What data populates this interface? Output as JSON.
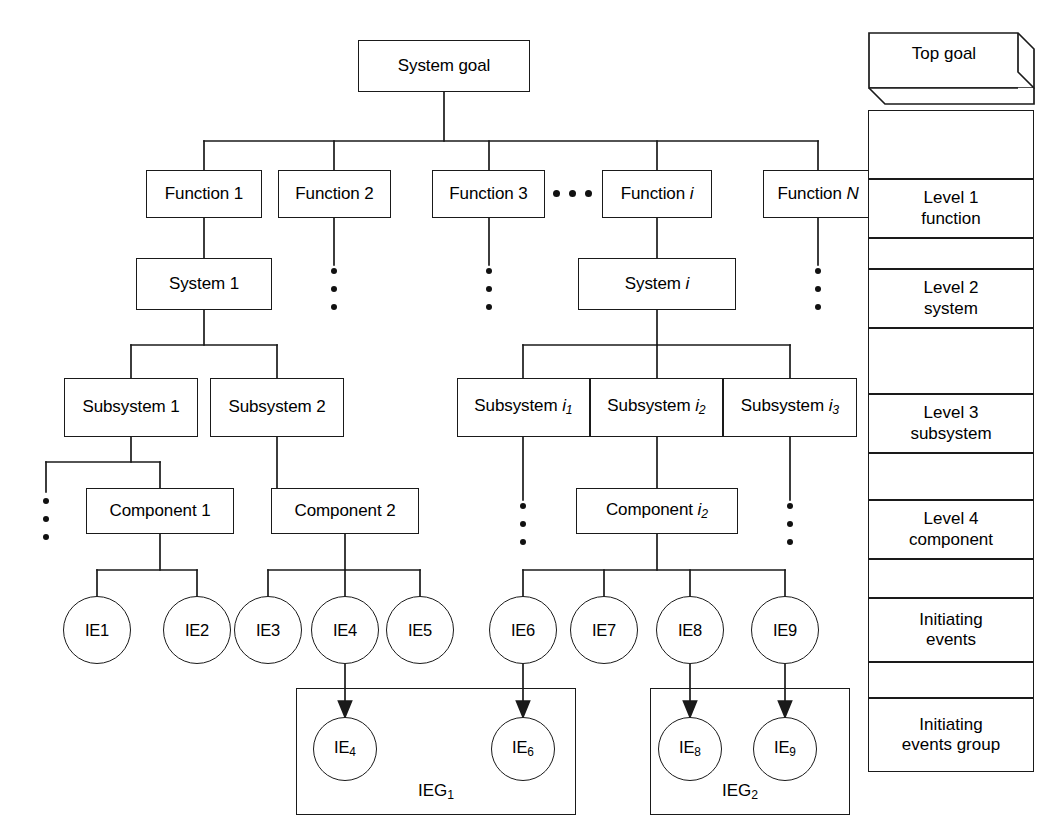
{
  "diagram": {
    "top": {
      "label": "System goal"
    },
    "functions": [
      {
        "label": "Function 1"
      },
      {
        "label": "Function 2"
      },
      {
        "label": "Function 3"
      },
      {
        "label": "Function i"
      },
      {
        "label": "Function N"
      }
    ],
    "systems": [
      {
        "label": "System 1"
      },
      {
        "label": "System i"
      }
    ],
    "subsystems": [
      {
        "label": "Subsystem 1"
      },
      {
        "label": "Subsystem 2"
      },
      {
        "label": "Subsystem i1"
      },
      {
        "label": "Subsystem i2"
      },
      {
        "label": "Subsystem i3"
      }
    ],
    "components": [
      {
        "label": "Component 1"
      },
      {
        "label": "Component 2"
      },
      {
        "label": "Component i2"
      }
    ],
    "initiating_events": [
      {
        "label": "IE1"
      },
      {
        "label": "IE2"
      },
      {
        "label": "IE3"
      },
      {
        "label": "IE4"
      },
      {
        "label": "IE5"
      },
      {
        "label": "IE6"
      },
      {
        "label": "IE7"
      },
      {
        "label": "IE8"
      },
      {
        "label": "IE9"
      }
    ],
    "groups": [
      {
        "label": "IEG1",
        "members": [
          {
            "label": "IE4"
          },
          {
            "label": "IE6"
          }
        ]
      },
      {
        "label": "IEG2",
        "members": [
          {
            "label": "IE8"
          },
          {
            "label": "IE9"
          }
        ]
      }
    ]
  },
  "legend": {
    "rows": [
      {
        "label": "Top goal"
      },
      {
        "label": "Level 1 function"
      },
      {
        "label": "Level 2 system"
      },
      {
        "label": "Level 3 subsystem"
      },
      {
        "label": "Level 4 component"
      },
      {
        "label": "Initiating events"
      },
      {
        "label": "Initiating events group"
      }
    ]
  },
  "style": {
    "line_color": "#1a1a1a",
    "background": "#ffffff",
    "text_color": "#000000"
  }
}
